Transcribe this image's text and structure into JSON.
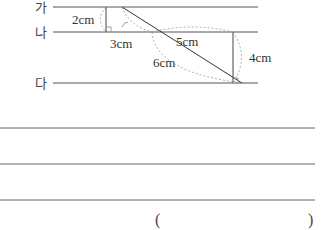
{
  "diagram": {
    "line_labels": [
      "가",
      "나",
      "다"
    ],
    "measurements": {
      "ga_na_distance": "2cm",
      "small_base": "3cm",
      "diagonal_upper": "5cm",
      "diagonal_lower": "6cm",
      "na_da_distance": "4cm"
    },
    "colors": {
      "line": "#555555",
      "dashed_arc": "#999999"
    }
  },
  "answer": {
    "open_paren": "(",
    "close_paren": ")"
  }
}
